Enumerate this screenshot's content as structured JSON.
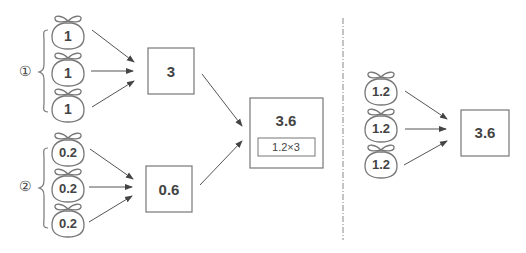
{
  "group1": {
    "marker": "①",
    "bags": [
      "1",
      "1",
      "1"
    ],
    "result": "3"
  },
  "group2": {
    "marker": "②",
    "bags": [
      "0.2",
      "0.2",
      "0.2"
    ],
    "result": "0.6"
  },
  "combined": {
    "value": "3.6",
    "formula": "1.2×3"
  },
  "right": {
    "bags": [
      "1.2",
      "1.2",
      "1.2"
    ],
    "result": "3.6"
  },
  "colors": {
    "stroke": "#6b6b6b",
    "text": "#444444",
    "background": "#ffffff"
  }
}
